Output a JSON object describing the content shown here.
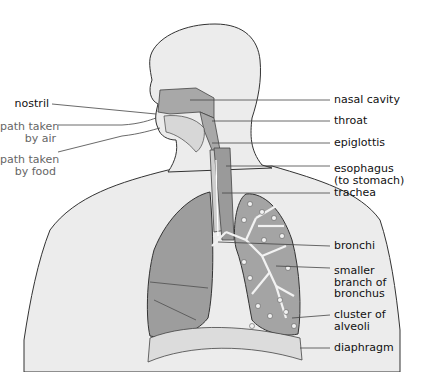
{
  "diagram": {
    "colors": {
      "body_fill": "#eaeaea",
      "organ_fill": "#9d9d9d",
      "outline": "#333333",
      "leader": "#444444",
      "path_label": "#666666"
    },
    "labels_left": [
      {
        "id": "nostril",
        "text": "nostril"
      },
      {
        "id": "air_path",
        "text": "path taken\nby air"
      },
      {
        "id": "food_path",
        "text": "path taken\nby food"
      }
    ],
    "labels_right": [
      {
        "id": "nasal_cavity",
        "text": "nasal cavity"
      },
      {
        "id": "throat",
        "text": "throat"
      },
      {
        "id": "epiglottis",
        "text": "epiglottis"
      },
      {
        "id": "esophagus",
        "text": "esophagus\n(to stomach)"
      },
      {
        "id": "trachea",
        "text": "trachea"
      },
      {
        "id": "bronchi",
        "text": "bronchi"
      },
      {
        "id": "smaller_branch",
        "text": "smaller\nbranch of\nbronchus"
      },
      {
        "id": "alveoli",
        "text": "cluster of\nalveoli"
      },
      {
        "id": "diaphragm",
        "text": "diaphragm"
      }
    ]
  }
}
